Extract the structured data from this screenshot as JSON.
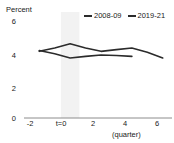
{
  "chart_data": {
    "type": "line",
    "title": "",
    "subtitle": "",
    "xlabel": "(quarter)",
    "ylabel": "Percent",
    "xlim": [
      -2.6,
      6.6
    ],
    "ylim": [
      0,
      6
    ],
    "grid": false,
    "legend_position": "top-right",
    "x_ticks": [
      -2,
      0,
      2,
      4,
      6
    ],
    "x_tick_labels": [
      "-2",
      "t=0",
      "2",
      "4",
      "6"
    ],
    "y_ticks": [
      0,
      2,
      4,
      6
    ],
    "y_tick_labels": [
      "0",
      "2",
      "4",
      "6"
    ],
    "shaded_band": {
      "from": -0.6,
      "to": 0.6,
      "color": "#f2f2f2"
    },
    "series": [
      {
        "name": "2008-09",
        "color": "#2b2b2b",
        "x": [
          -2,
          -1,
          0,
          1,
          2,
          3,
          4,
          5,
          6
        ],
        "values": [
          4.0,
          4.2,
          4.45,
          4.2,
          4.0,
          4.1,
          4.2,
          3.95,
          3.6
        ]
      },
      {
        "name": "2019-21",
        "color": "#2b2b2b",
        "x": [
          -2,
          -1,
          0,
          1,
          2,
          3,
          4
        ],
        "values": [
          4.05,
          3.85,
          3.6,
          3.7,
          3.78,
          3.75,
          3.7
        ]
      }
    ]
  },
  "legend": {
    "entries": [
      {
        "label": "2008-09"
      },
      {
        "label": "2019-21"
      }
    ]
  },
  "axis": {
    "y_title": "Percent",
    "x_title": "(quarter)"
  },
  "y_tick_labels": {
    "t0": "0",
    "t2": "2",
    "t4": "4",
    "t6": "6"
  },
  "x_tick_labels": {
    "m2": "-2",
    "zero": "t=0",
    "p2": "2",
    "p4": "4",
    "p6": "6"
  }
}
